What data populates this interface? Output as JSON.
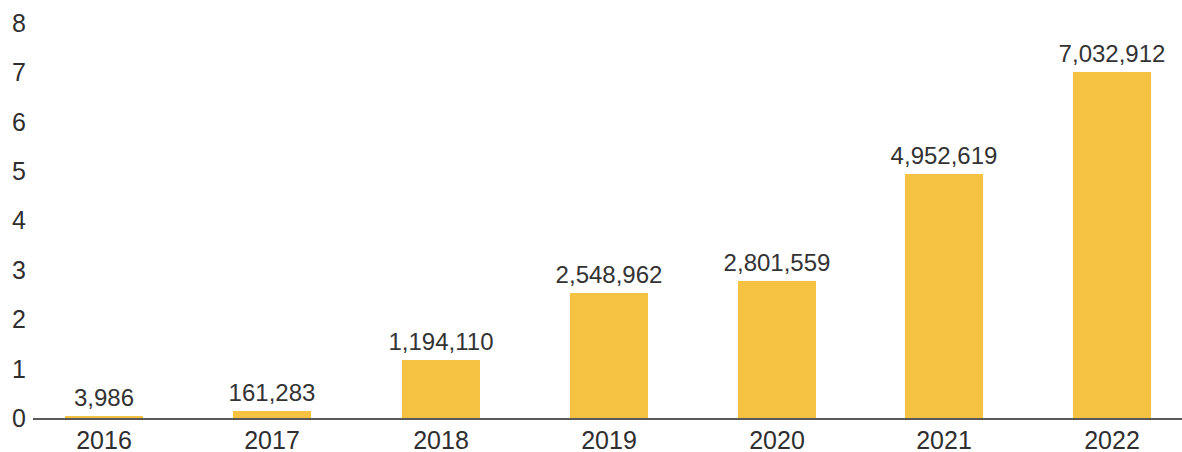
{
  "chart_data": {
    "type": "bar",
    "title": "",
    "subtitle": "",
    "xlabel": "",
    "ylabel": "",
    "categories": [
      "2016",
      "2017",
      "2018",
      "2019",
      "2020",
      "2021",
      "2022"
    ],
    "values": [
      3986,
      161283,
      1194110,
      2548962,
      2801559,
      4952619,
      7032912
    ],
    "value_labels": [
      "3,986",
      "161,283",
      "1,194,110",
      "2,548,962",
      "2,801,559",
      "4,952,619",
      "7,032,912"
    ],
    "y_ticks": [
      0,
      1,
      2,
      3,
      4,
      5,
      6,
      7,
      8
    ],
    "y_tick_labels": [
      "0",
      "1",
      "2",
      "3",
      "4",
      "5",
      "6",
      "7",
      "8"
    ],
    "y_unit_scale": 1000000,
    "ylim": [
      0,
      8000000
    ],
    "grid": false,
    "legend": null,
    "series": [
      {
        "name": "",
        "color": "#f5c341",
        "values": [
          3986,
          161283,
          1194110,
          2548962,
          2801559,
          4952619,
          7032912
        ]
      }
    ],
    "colors": {
      "bar": "#f5c341",
      "axis": "#5a5a5a",
      "tick_text": "#2f2f2f",
      "value_text": "#333333",
      "background": "#ffffff"
    }
  }
}
